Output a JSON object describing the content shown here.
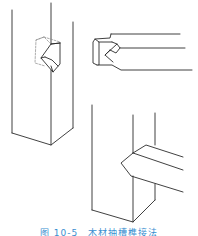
{
  "figure": {
    "stroke_color": "#2b2b2b",
    "dashed_color": "#8a8a8a",
    "parts": [
      {
        "name": "vertical-post-with-notch",
        "position": "left"
      },
      {
        "name": "horizontal-beam-with-tenon",
        "position": "top-right"
      },
      {
        "name": "assembled-joint",
        "position": "bottom-right"
      }
    ]
  },
  "caption": {
    "text": "图 10-5　木材抽槽榫接法",
    "color": "#3a8fd0"
  }
}
